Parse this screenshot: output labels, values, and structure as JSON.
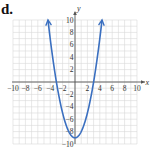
{
  "panel_label": "d.",
  "chart_data": {
    "type": "line",
    "title": "",
    "function": "y = x^2 - 9",
    "xlabel": "x",
    "ylabel": "y",
    "xlim": [
      -10,
      10
    ],
    "ylim": [
      -10,
      10
    ],
    "grid": true,
    "legend": null,
    "x_ticks": [
      -10,
      -8,
      -6,
      -4,
      -2,
      2,
      4,
      6,
      8,
      10
    ],
    "y_ticks": [
      10,
      8,
      6,
      4,
      2,
      -2,
      -4,
      -6,
      -8,
      -10
    ],
    "x_tick_labels": [
      "−10",
      "−8",
      "−6",
      "−4",
      "−2",
      "2",
      "4",
      "6",
      "8",
      "10"
    ],
    "y_tick_labels": [
      "10",
      "8",
      "6",
      "4",
      "2",
      "−2",
      "−4",
      "−6",
      "−8",
      "−10"
    ],
    "series": [
      {
        "name": "parabola",
        "color": "#3a6fc0",
        "x": [
          -4.36,
          -4,
          -3,
          -2,
          -1,
          0,
          1,
          2,
          3,
          4,
          4.36
        ],
        "y": [
          10,
          7,
          0,
          -5,
          -8,
          -9,
          -8,
          -5,
          0,
          7,
          10
        ],
        "arrows_at_ends": true
      }
    ],
    "annotations": {
      "vertex": [
        0,
        -9
      ],
      "x_intercepts": [
        -3,
        3
      ]
    }
  },
  "colors": {
    "curve": "#3a6fc0",
    "grid": "#d8d8d8",
    "axis": "#555555"
  }
}
